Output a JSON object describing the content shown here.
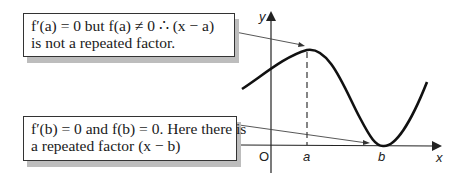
{
  "annotations": [
    {
      "id": "max-point-note",
      "lines": [
        "f′(a) = 0  but  f(a) ≠ 0  ∴ (x − a)",
        "is not a repeated factor."
      ]
    },
    {
      "id": "repeated-root-note",
      "lines": [
        "f′(b) = 0 and f(b) = 0. Here there is",
        "a repeated factor (x − b)"
      ]
    }
  ],
  "graph": {
    "x_axis_label": "x",
    "y_axis_label": "y",
    "origin_label": "O",
    "point_labels": [
      "a",
      "b"
    ]
  }
}
